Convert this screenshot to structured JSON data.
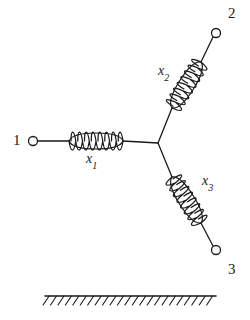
{
  "figure": {
    "type": "mechanical-schematic",
    "title": "",
    "background_color": "#ffffff",
    "stroke_color": "#1a1a1a",
    "canvas": {
      "width": 250,
      "height": 320
    }
  },
  "nodes": [
    {
      "id": "node-1",
      "label": "1",
      "label_x": 13,
      "label_y": 133,
      "cx": 33,
      "cy": 141,
      "r": 4.5
    },
    {
      "id": "node-2",
      "label": "2",
      "label_x": 228,
      "label_y": 6,
      "cx": 216,
      "cy": 33,
      "r": 4.5
    },
    {
      "id": "node-3",
      "label": "3",
      "label_x": 228,
      "label_y": 262,
      "cx": 216,
      "cy": 250,
      "r": 4.5
    }
  ],
  "junction": {
    "x": 158,
    "y": 143
  },
  "springs": [
    {
      "id": "spring-x1",
      "label": "x",
      "subscript": "1",
      "label_x": 86,
      "label_y": 152,
      "x1": 69,
      "y1": 141,
      "x2": 123,
      "y2": 141,
      "coils": 8,
      "amplitude": 8
    },
    {
      "id": "spring-x2",
      "label": "x",
      "subscript": "2",
      "label_x": 158,
      "label_y": 64,
      "x1": 172,
      "y1": 108,
      "x2": 201,
      "y2": 62,
      "coils": 8,
      "amplitude": 8
    },
    {
      "id": "spring-x3",
      "label": "x",
      "subscript": "3",
      "label_x": 202,
      "label_y": 174,
      "x1": 172,
      "y1": 177,
      "x2": 201,
      "y2": 223,
      "coils": 8,
      "amplitude": 8
    }
  ],
  "connectors": [
    {
      "id": "conn-node1-spring1",
      "x1": 38,
      "y1": 141,
      "x2": 69,
      "y2": 141
    },
    {
      "id": "conn-spring1-junction",
      "x1": 123,
      "y1": 141,
      "x2": 158,
      "y2": 143
    },
    {
      "id": "conn-junction-spring2",
      "x1": 158,
      "y1": 143,
      "x2": 172,
      "y2": 108
    },
    {
      "id": "conn-spring2-node2",
      "x1": 201,
      "y1": 62,
      "x2": 213,
      "y2": 37
    },
    {
      "id": "conn-junction-spring3",
      "x1": 158,
      "y1": 143,
      "x2": 172,
      "y2": 177
    },
    {
      "id": "conn-spring3-node3",
      "x1": 201,
      "y1": 223,
      "x2": 213,
      "y2": 246
    }
  ],
  "ground": {
    "id": "ground-hatch",
    "line_x1": 45,
    "line_x2": 216,
    "line_y": 296,
    "hatch_count": 23,
    "hatch_dx": -6,
    "hatch_dy": 9
  }
}
